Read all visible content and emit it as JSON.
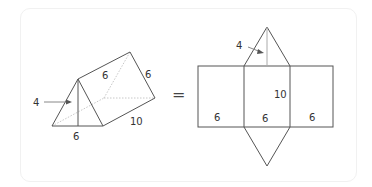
{
  "prism": {
    "labels": {
      "height": "4",
      "base": "6",
      "slant_front": "6",
      "slant_back": "6",
      "length": "10"
    }
  },
  "equals_sign": "=",
  "net": {
    "labels": {
      "height": "4",
      "length": "10",
      "left_face_width": "6",
      "middle_face_width": "6",
      "right_face_width": "6"
    }
  },
  "colors": {
    "stroke": "#555555",
    "hidden_edge": "#c8c8c8",
    "text": "#333333"
  }
}
